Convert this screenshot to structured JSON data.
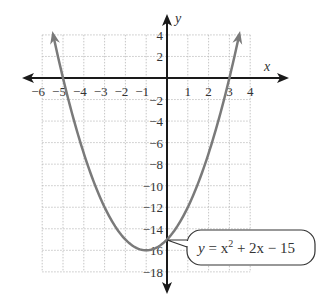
{
  "chart_data": {
    "type": "line",
    "title": "",
    "xlabel": "x",
    "ylabel": "y",
    "xlim": [
      -6,
      4
    ],
    "ylim": [
      -18,
      4
    ],
    "grid": true,
    "x_ticks": [
      "−6",
      "−5",
      "−4",
      "−3",
      "−2",
      "−1",
      "1",
      "2",
      "3",
      "4"
    ],
    "y_ticks": [
      "4",
      "2",
      "−2",
      "−4",
      "−6",
      "−8",
      "−10",
      "−12",
      "−14",
      "−16",
      "−18"
    ],
    "series": [
      {
        "name": "y = x^2 + 2x − 15",
        "x": [
          -5.47,
          -5,
          -4,
          -3,
          -2,
          -1,
          0,
          1,
          2,
          3,
          3.47
        ],
        "y": [
          4,
          0,
          -7,
          -12,
          -15,
          -16,
          -15,
          -12,
          -7,
          0,
          4
        ]
      }
    ],
    "annotations": [
      {
        "text_y": "y",
        "text_eq": " = x",
        "sup": "2",
        "text_rest": " + 2x − 15",
        "points_to": [
          0,
          -15
        ]
      }
    ],
    "colors": {
      "curve": "#7a7a7a",
      "axis": "#1a1a1a",
      "grid": "#b8b8b8"
    }
  },
  "labels": {
    "x_axis": "x",
    "y_axis": "y",
    "callout_y": "y",
    "callout_mid": " = x",
    "callout_sup": "2",
    "callout_rest": " + 2x − 15"
  }
}
